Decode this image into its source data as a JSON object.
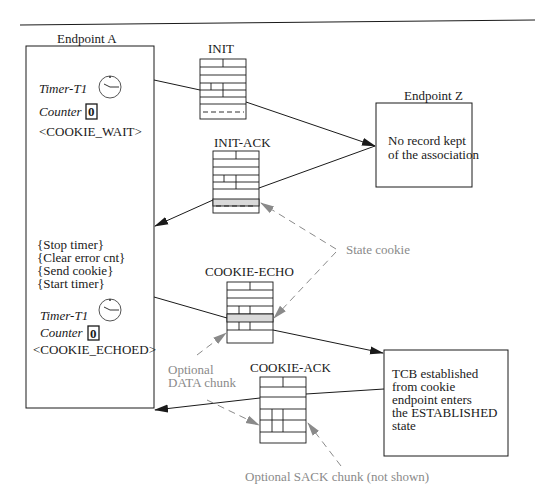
{
  "endpoint_a": {
    "title": "Endpoint A",
    "timer_label_1": "Timer-T1",
    "counter_label_1": "Counter",
    "counter_value_1": "0",
    "state_1": "<COOKIE_WAIT>",
    "actions": [
      "{Stop timer}",
      "{Clear error cnt}",
      "{Send cookie}",
      "{Start timer}"
    ],
    "timer_label_2": "Timer-T1",
    "counter_label_2": "Counter",
    "counter_value_2": "0",
    "state_2": "<COOKIE_ECHOED>"
  },
  "endpoint_z": {
    "title": "Endpoint Z",
    "note_lines": [
      "No record kept",
      "of the association"
    ],
    "established_lines": [
      "TCB established",
      "from cookie",
      "endpoint enters",
      "the ESTABLISHED",
      "state"
    ]
  },
  "packets": {
    "init": "INIT",
    "init_ack": "INIT-ACK",
    "cookie_echo": "COOKIE-ECHO",
    "cookie_ack": "COOKIE-ACK"
  },
  "annotations": {
    "state_cookie": "State cookie",
    "optional_data": [
      "Optional",
      "DATA chunk"
    ],
    "optional_sack": "Optional SACK chunk (not shown)"
  },
  "colors": {
    "line": "#1a1a1a",
    "annotation_gray": "#8a8a8a",
    "highlight_fill": "#d9d9d9"
  }
}
